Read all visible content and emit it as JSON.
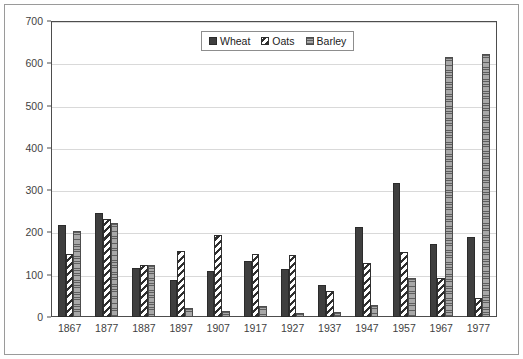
{
  "chart_data": {
    "type": "bar",
    "title": "",
    "subtitle": "",
    "xlabel": "",
    "ylabel": "",
    "ylim": [
      0,
      700
    ],
    "y_ticks": [
      0,
      100,
      200,
      300,
      400,
      500,
      600,
      700
    ],
    "grid": true,
    "legend_position": "top-center",
    "categories": [
      "1867",
      "1877",
      "1887",
      "1897",
      "1907",
      "1917",
      "1927",
      "1937",
      "1947",
      "1957",
      "1967",
      "1977"
    ],
    "series": [
      {
        "name": "Wheat",
        "fill": "solid-dark",
        "color": "#3f3f3f",
        "values": [
          218,
          245,
          115,
          88,
          110,
          132,
          113,
          75,
          213,
          318,
          172,
          190
        ]
      },
      {
        "name": "Oats",
        "fill": "diagonal-hatch",
        "color": "#ffffff",
        "values": [
          150,
          232,
          122,
          157,
          195,
          148,
          146,
          62,
          128,
          153,
          92,
          44
        ]
      },
      {
        "name": "Barley",
        "fill": "gray-horizontal-lines",
        "color": "#9e9e9e",
        "values": [
          203,
          222,
          122,
          22,
          15,
          25,
          9,
          13,
          29,
          92,
          615,
          622
        ]
      }
    ]
  },
  "legend": {
    "items": [
      {
        "label": "Wheat"
      },
      {
        "label": "Oats"
      },
      {
        "label": "Barley"
      }
    ]
  }
}
